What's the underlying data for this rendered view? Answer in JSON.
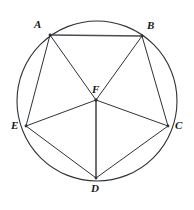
{
  "figure": {
    "background_color": "#ffffff",
    "stroke_color": "#2f3134",
    "emphasis_stroke_color": "#4a4c50",
    "label_color": "#17181a",
    "width": 194,
    "height": 210
  },
  "circle": {
    "name": "circumscribed-circle",
    "cx": 97,
    "cy": 101,
    "r": 80,
    "stroke_width": 1.1
  },
  "points": [
    {
      "id": "A",
      "label": "A",
      "x": 50,
      "y": 35,
      "label_x": 34,
      "label_y": 19,
      "on_circle": true,
      "dot": true
    },
    {
      "id": "B",
      "label": "B",
      "x": 142,
      "y": 36,
      "label_x": 147,
      "label_y": 20,
      "on_circle": true,
      "dot": true
    },
    {
      "id": "C",
      "label": "C",
      "x": 168,
      "y": 126,
      "label_x": 175,
      "label_y": 120,
      "on_circle": true,
      "dot": true
    },
    {
      "id": "D",
      "label": "D",
      "x": 96,
      "y": 178,
      "label_x": 91,
      "label_y": 183,
      "on_circle": true,
      "dot": true
    },
    {
      "id": "E",
      "label": "E",
      "x": 26,
      "y": 126,
      "label_x": 11,
      "label_y": 120,
      "on_circle": true,
      "dot": true
    },
    {
      "id": "F",
      "label": "F",
      "x": 96,
      "y": 100,
      "label_x": 92,
      "label_y": 84,
      "on_circle": false,
      "dot": true
    }
  ],
  "segments": [
    {
      "id": "AB",
      "from": "A",
      "to": "B",
      "kind": "chord",
      "stroke_width": 1.5
    },
    {
      "id": "BC",
      "from": "B",
      "to": "C",
      "kind": "chord",
      "stroke_width": 1.0
    },
    {
      "id": "CD",
      "from": "C",
      "to": "D",
      "kind": "chord",
      "stroke_width": 1.0
    },
    {
      "id": "DE",
      "from": "D",
      "to": "E",
      "kind": "chord",
      "stroke_width": 1.0
    },
    {
      "id": "EA",
      "from": "E",
      "to": "A",
      "kind": "chord",
      "stroke_width": 1.0
    },
    {
      "id": "FA",
      "from": "F",
      "to": "A",
      "kind": "radius",
      "stroke_width": 1.0
    },
    {
      "id": "FB",
      "from": "F",
      "to": "B",
      "kind": "radius",
      "stroke_width": 1.0
    },
    {
      "id": "FC",
      "from": "F",
      "to": "C",
      "kind": "radius",
      "stroke_width": 1.0
    },
    {
      "id": "FD",
      "from": "F",
      "to": "D",
      "kind": "radius",
      "stroke_width": 1.6
    },
    {
      "id": "FE",
      "from": "F",
      "to": "E",
      "kind": "radius",
      "stroke_width": 1.0
    }
  ]
}
